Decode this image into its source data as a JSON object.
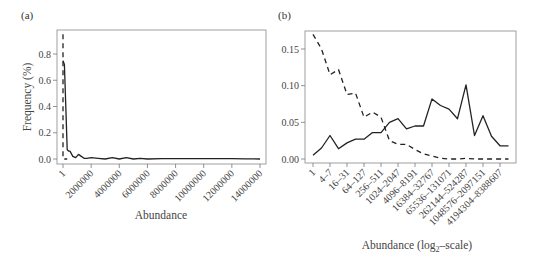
{
  "chart_data": [
    {
      "panel": "(a)",
      "type": "line",
      "title": "",
      "xlabel": "Abundance",
      "ylabel": "Frequency (%)",
      "xlim": [
        1,
        14000000
      ],
      "ylim": [
        0,
        0.95
      ],
      "x_ticks": [
        "1",
        "2000000",
        "4000000",
        "6000000",
        "8000000",
        "10000000",
        "12000000",
        "14000000"
      ],
      "y_ticks": [
        "0.0",
        "0.2",
        "0.4",
        "0.6",
        "0.8"
      ],
      "grid": false,
      "series": [
        {
          "name": "solid",
          "style": "solid",
          "x": [
            1,
            100000,
            200000,
            300000,
            400000,
            500000,
            700000,
            900000,
            1100000,
            1300000,
            1500000,
            1700000,
            2000000,
            2500000,
            3000000,
            3500000,
            4000000,
            4500000,
            5000000,
            5500000,
            6000000,
            7000000,
            8000000,
            9000000,
            10000000,
            11000000,
            12000000,
            13000000,
            14000000
          ],
          "values": [
            0.75,
            0.72,
            0.4,
            0.07,
            0.06,
            0.06,
            0.02,
            0.01,
            0.035,
            0.02,
            0.005,
            0.005,
            0.01,
            0.005,
            0.0,
            0.01,
            0.0,
            0.01,
            0.0,
            0.005,
            0.0,
            0.003,
            0.003,
            0.002,
            0.003,
            0.002,
            0.003,
            0.001,
            0.0
          ]
        },
        {
          "name": "dashed",
          "style": "dashed",
          "x": [
            1,
            1,
            300000
          ],
          "values": [
            0.95,
            0.0,
            0.0
          ]
        }
      ]
    },
    {
      "panel": "(b)",
      "type": "line",
      "title": "",
      "xlabel": "Abundance (log2-scale)",
      "ylabel": "",
      "ylim": [
        0,
        0.17
      ],
      "y_ticks": [
        "0.00",
        "0.05",
        "0.10",
        "0.15"
      ],
      "grid": false,
      "categories": [
        "1",
        "2–3",
        "4–7",
        "8–15",
        "16–31",
        "32–63",
        "64–127",
        "128–255",
        "256–511",
        "512–1023",
        "1024–2047",
        "2048–4095",
        "4096–8191",
        "8192–16383",
        "16384–32767",
        "32768–65535",
        "65536–131071",
        "131072–262143",
        "262144–524287",
        "524288–1048575",
        "1048576–2097151",
        "2097152–4194303",
        "4194304–8388607",
        "8388608–16777215"
      ],
      "x_tick_labels_shown": [
        "1",
        "4–7",
        "16–31",
        "64–127",
        "256–511",
        "1024–2047",
        "4096–8191",
        "16384–32767",
        "65536–131071",
        "262144–524287",
        "1048576–2097151",
        "4194304–8388607"
      ],
      "series": [
        {
          "name": "solid",
          "style": "solid",
          "values": [
            0.005,
            0.015,
            0.032,
            0.014,
            0.022,
            0.027,
            0.027,
            0.036,
            0.036,
            0.05,
            0.055,
            0.041,
            0.045,
            0.045,
            0.082,
            0.073,
            0.068,
            0.055,
            0.101,
            0.032,
            0.059,
            0.031,
            0.018,
            0.018
          ]
        },
        {
          "name": "dashed",
          "style": "dashed",
          "values": [
            0.17,
            0.15,
            0.115,
            0.122,
            0.088,
            0.09,
            0.057,
            0.064,
            0.057,
            0.025,
            0.02,
            0.02,
            0.013,
            0.007,
            0.004,
            0.001,
            0.0,
            0.0,
            0.001,
            0.0,
            0.0,
            0.0,
            0.0,
            0.0
          ]
        }
      ]
    }
  ],
  "labels": {
    "panel_a": "(a)",
    "panel_b": "(b)",
    "a_xlabel": "Abundance",
    "a_ylabel": "Frequency (%)",
    "b_xlabel_pre": "Abundance (log",
    "b_xlabel_sub": "2",
    "b_xlabel_post": "–scale)"
  },
  "colors": {
    "line": "#222222",
    "axis": "#777777",
    "text": "#444444"
  }
}
